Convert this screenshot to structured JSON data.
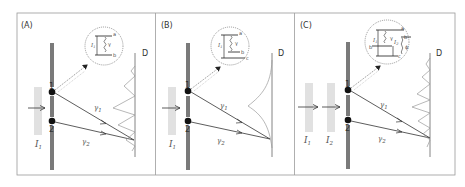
{
  "figure": {
    "panels": [
      {
        "id": "A",
        "label": "(A)",
        "slit_labels": [
          "1",
          "2"
        ],
        "photon_labels": [
          "γ1",
          "γ2"
        ],
        "gamma_1": "γ",
        "gamma_sub_1": "1",
        "gamma_2": "γ",
        "gamma_sub_2": "2",
        "detector_label": "D",
        "sources": [
          {
            "label": "I",
            "sub": "1"
          }
        ],
        "inset": {
          "levels": [
            "a",
            "b"
          ],
          "field": "I",
          "field_sub": "1",
          "gamma": "γ"
        },
        "pattern": "interference"
      },
      {
        "id": "B",
        "label": "(B)",
        "slit_labels": [
          "1",
          "2"
        ],
        "gamma_1": "γ",
        "gamma_sub_1": "1",
        "gamma_2": "γ",
        "gamma_sub_2": "2",
        "detector_label": "D",
        "sources": [
          {
            "label": "I",
            "sub": "1"
          }
        ],
        "inset": {
          "levels": [
            "a",
            "b",
            "c"
          ],
          "field": "I",
          "field_sub": "1",
          "gamma": "γ"
        },
        "pattern": "no-interference"
      },
      {
        "id": "C",
        "label": "(C)",
        "slit_labels": [
          "1",
          "2"
        ],
        "gamma_1": "γ",
        "gamma_sub_1": "1",
        "gamma_2": "γ",
        "gamma_sub_2": "2",
        "detector_label": "D",
        "sources": [
          {
            "label": "I",
            "sub": "1"
          },
          {
            "label": "I",
            "sub": "2"
          }
        ],
        "inset": {
          "levels": [
            "a",
            "b",
            "c",
            "b"
          ],
          "field": "I",
          "field_sub": "1",
          "field2": "I",
          "field2_sub": "2",
          "gamma": "γ",
          "phi": "ϕ"
        },
        "pattern": "interference"
      }
    ]
  }
}
